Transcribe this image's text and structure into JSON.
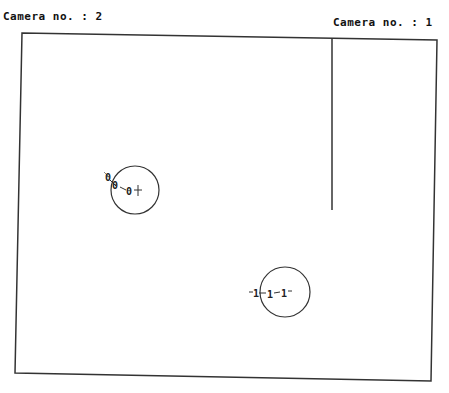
{
  "labels": {
    "camera_left": "Camera no. : 2",
    "camera_right": "Camera no. : 1"
  },
  "scene": {
    "frame": {
      "corners": [
        [
          22,
          33
        ],
        [
          437,
          40
        ],
        [
          431,
          381
        ],
        [
          15,
          373
        ]
      ],
      "stroke": "#333333"
    },
    "divider_line": {
      "x": 332,
      "y1": 38,
      "y2": 210
    },
    "objects": [
      {
        "id": "camera-2-target",
        "circle": {
          "cx": 135,
          "cy": 190,
          "r": 24
        },
        "markers": [
          "0",
          "0",
          "0"
        ]
      },
      {
        "id": "camera-1-target",
        "circle": {
          "cx": 285,
          "cy": 292,
          "r": 25
        },
        "markers": [
          "1",
          "1",
          "1"
        ]
      }
    ]
  }
}
